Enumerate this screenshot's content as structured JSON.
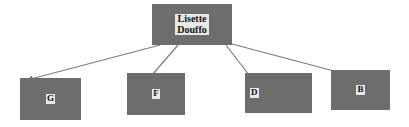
{
  "diagram": {
    "type": "tree",
    "title": "",
    "background_color": "#ffffff",
    "node_fill_color": "#6d6d6d",
    "label_background_color": "#e8e8e6",
    "label_text_color": "#111111",
    "edge_color": "#808080",
    "root": {
      "id": "root",
      "label": "Lisette\nDouffo",
      "line1": "Lisette",
      "line2": "Douffo",
      "x": 152,
      "y": 4,
      "width": 80,
      "height": 41
    },
    "children": [
      {
        "id": "child-g",
        "label": "G",
        "x": 20,
        "y": 78,
        "width": 61,
        "height": 42,
        "label_align": "center",
        "edge": {
          "from_x": 160,
          "from_y": 45,
          "to_x": 25,
          "to_y": 80,
          "arrowhead": true
        }
      },
      {
        "id": "child-f",
        "label": "F",
        "x": 127,
        "y": 73,
        "width": 58,
        "height": 42,
        "label_align": "center",
        "edge": {
          "from_x": 178,
          "from_y": 45,
          "to_x": 152,
          "to_y": 75,
          "arrowhead": false
        }
      },
      {
        "id": "child-d",
        "label": "D",
        "x": 245,
        "y": 73,
        "width": 67,
        "height": 40,
        "label_align": "left",
        "edge": {
          "from_x": 226,
          "from_y": 45,
          "to_x": 249,
          "to_y": 75,
          "arrowhead": false
        }
      },
      {
        "id": "child-b",
        "label": "B",
        "x": 331,
        "y": 70,
        "width": 59,
        "height": 40,
        "label_align": "center",
        "edge": {
          "from_x": 232,
          "from_y": 44,
          "to_x": 334,
          "to_y": 71,
          "arrowhead": false
        }
      }
    ]
  }
}
